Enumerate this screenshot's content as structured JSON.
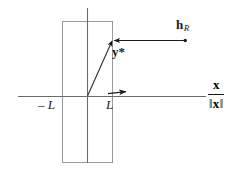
{
  "figure": {
    "type": "vector-geometry-diagram",
    "background_color": "#ffffff",
    "ink_color": "#1a1a1a",
    "axis_color": "#6b6b6b",
    "box_color": "#9a9a9a",
    "labels": {
      "minus_L": "– L",
      "L": "L",
      "y_star": "y",
      "y_star_mark": "*",
      "h_vector": "h",
      "h_subscript": "R",
      "axis_numerator": "x",
      "axis_denominator_open": "‖",
      "axis_denominator_var": "x",
      "axis_denominator_close": "‖"
    },
    "geometry": {
      "x_axis": {
        "x1": 18,
        "y1": 96,
        "x2": 206,
        "y2": 96
      },
      "y_axis": {
        "x1": 87,
        "y1": 8,
        "x2": 87,
        "y2": 163
      },
      "origin": {
        "x": 87,
        "y": 96
      },
      "box": {
        "x": 62,
        "y": 21,
        "width": 50,
        "height": 142
      },
      "box_left_tick": -1,
      "box_right_tick": 1,
      "y_star_vector": {
        "x1": 87,
        "y1": 96,
        "x2": 113,
        "y2": 40
      },
      "h_point": {
        "x": 185,
        "y": 40
      },
      "projection_arrow": {
        "x1": 185,
        "y1": 40,
        "x2": 112,
        "y2": 40
      },
      "x_axis_arrow": {
        "x1": 106,
        "y1": 93,
        "x2": 131,
        "y2": 91
      }
    }
  }
}
